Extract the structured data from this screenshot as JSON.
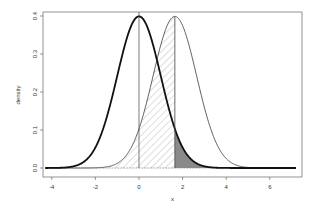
{
  "chart_data": {
    "type": "line",
    "title": "",
    "xlabel": "x",
    "ylabel": "density",
    "xlim": [
      -4.3,
      7.2
    ],
    "ylim": [
      -0.01,
      0.41
    ],
    "x_ticks": [
      -4,
      -2,
      0,
      2,
      4,
      6
    ],
    "y_ticks": [
      0.0,
      0.1,
      0.2,
      0.3,
      0.4
    ],
    "x_tick_labels": [
      "-4",
      "-2",
      "0",
      "2",
      "4",
      "6"
    ],
    "y_tick_labels": [
      "0.0",
      "0.1",
      "0.2",
      "0.3",
      "0.4"
    ],
    "series": [
      {
        "name": "null N(0,1)",
        "mean": 0,
        "sd": 1,
        "line": "thick",
        "color": "#111111"
      },
      {
        "name": "alternative N(1.645,1)",
        "mean": 1.645,
        "sd": 1,
        "line": "thin",
        "color": "#333333"
      }
    ],
    "vertical_lines": [
      0,
      1.645
    ],
    "shaded_regions": [
      {
        "name": "hatched area under alternative left of critical value",
        "from": -4.3,
        "to": 1.645,
        "curve": "alternative",
        "style": "hatch"
      },
      {
        "name": "dark area under null right of critical value",
        "from": 1.645,
        "to": 7.2,
        "curve": "null",
        "style": "solid-gray"
      }
    ],
    "critical_value": 1.645,
    "grid": false,
    "legend": null
  }
}
